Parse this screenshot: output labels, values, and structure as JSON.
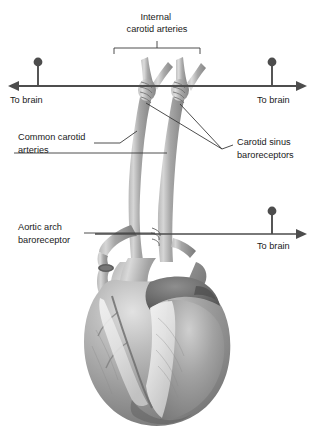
{
  "figure": {
    "type": "anatomical-diagram",
    "background_color": "#ffffff",
    "line_color": "#4a4a4a",
    "text_color": "#1a1a1a",
    "vessel_color": "#9a9a9a",
    "heart_color": "#8d8d8d",
    "width": 315,
    "height": 428
  },
  "labels": {
    "internal_carotid": {
      "line1": "Internal",
      "line2": "carotid arteries",
      "x": 157,
      "y": 20
    },
    "common_carotid": {
      "line1": "Common carotid",
      "line2": "arteries",
      "x": 18,
      "y": 140
    },
    "carotid_sinus": {
      "line1": "Carotid sinus",
      "line2": "baroreceptors",
      "x": 237,
      "y": 145
    },
    "aortic_arch": {
      "line1": "Aortic arch",
      "line2": "baroreceptor",
      "x": 18,
      "y": 230
    },
    "to_brain_left": {
      "text": "To brain",
      "x": 10,
      "y": 103
    },
    "to_brain_right_top": {
      "text": "To brain",
      "x": 257,
      "y": 103
    },
    "to_brain_right_bottom": {
      "text": "To brain",
      "x": 257,
      "y": 245
    }
  },
  "nerve_arrows": [
    {
      "name": "left-carotid-nerve-to-brain",
      "direction": "left",
      "ball_x": 38,
      "ball_y": 62,
      "stem_bottom_y": 86,
      "line_y": 86,
      "line_from_x": 165,
      "line_to_x": 10
    },
    {
      "name": "right-carotid-nerve-to-brain",
      "direction": "right",
      "ball_x": 272,
      "ball_y": 62,
      "stem_bottom_y": 86,
      "line_y": 86,
      "line_from_x": 150,
      "line_to_x": 300
    },
    {
      "name": "aortic-nerve-to-brain",
      "direction": "right",
      "ball_x": 272,
      "ball_y": 212,
      "stem_bottom_y": 234,
      "line_y": 234,
      "line_from_x": 95,
      "line_to_x": 300
    }
  ],
  "bracket": {
    "name": "internal-carotid-bracket",
    "left_x": 114,
    "right_x": 200,
    "y": 48,
    "tick_down": 6,
    "center_x": 157,
    "tick_up": 6
  }
}
